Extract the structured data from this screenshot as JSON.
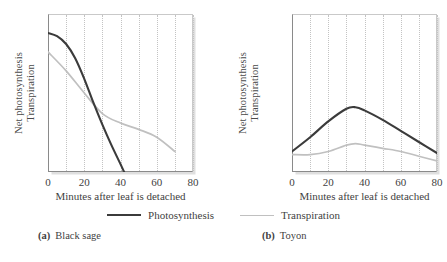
{
  "figure": {
    "ylabel_line1": "Net photosynthesis",
    "ylabel_line2": "Transpiration",
    "xlabel": "Minutes after leaf is detached",
    "xticks": [
      "0",
      "20",
      "40",
      "60",
      "80"
    ],
    "legend": [
      {
        "label": "Photosynthesis",
        "color": "#3b3b3b",
        "style": "dark"
      },
      {
        "label": "Transpiration",
        "color": "#c0c0c0",
        "style": "light"
      }
    ],
    "captions": [
      {
        "key": "(a)",
        "text": "Black sage"
      },
      {
        "key": "(b)",
        "text": "Toyon"
      }
    ]
  },
  "chart_data": [
    {
      "type": "line",
      "title": "(a) Black sage",
      "xlabel": "Minutes after leaf is detached",
      "ylabel": "Net photosynthesis / Transpiration",
      "xlim": [
        0,
        80
      ],
      "ylim": [
        0,
        100
      ],
      "xticks": [
        0,
        20,
        40,
        60,
        80
      ],
      "grid": "vertical-dotted-every-10",
      "legend_position": "below-figure",
      "series": [
        {
          "name": "Photosynthesis",
          "color": "#3b3b3b",
          "x": [
            0,
            5,
            10,
            15,
            20,
            25,
            30,
            35,
            40,
            42
          ],
          "values": [
            88,
            86,
            81,
            72,
            59,
            44,
            30,
            17,
            5,
            0
          ]
        },
        {
          "name": "Transpiration",
          "color": "#c0c0c0",
          "x": [
            0,
            10,
            20,
            30,
            40,
            50,
            60,
            70
          ],
          "values": [
            76,
            64,
            50,
            37,
            31,
            27,
            22,
            13
          ]
        }
      ]
    },
    {
      "type": "line",
      "title": "(b) Toyon",
      "xlabel": "Minutes after leaf is detached",
      "ylabel": "Net photosynthesis / Transpiration",
      "xlim": [
        0,
        80
      ],
      "ylim": [
        0,
        100
      ],
      "xticks": [
        0,
        20,
        40,
        60,
        80
      ],
      "grid": "vertical-dotted-every-10",
      "legend_position": "below-figure",
      "series": [
        {
          "name": "Photosynthesis",
          "color": "#3b3b3b",
          "x": [
            0,
            10,
            20,
            30,
            35,
            40,
            50,
            60,
            70,
            80
          ],
          "values": [
            13,
            22,
            32,
            40,
            41,
            39,
            33,
            26,
            19,
            12
          ]
        },
        {
          "name": "Transpiration",
          "color": "#c0c0c0",
          "x": [
            0,
            10,
            20,
            30,
            35,
            40,
            50,
            60,
            70,
            80
          ],
          "values": [
            11,
            11,
            13,
            17,
            18,
            17,
            15,
            13,
            10,
            7
          ]
        }
      ]
    }
  ]
}
